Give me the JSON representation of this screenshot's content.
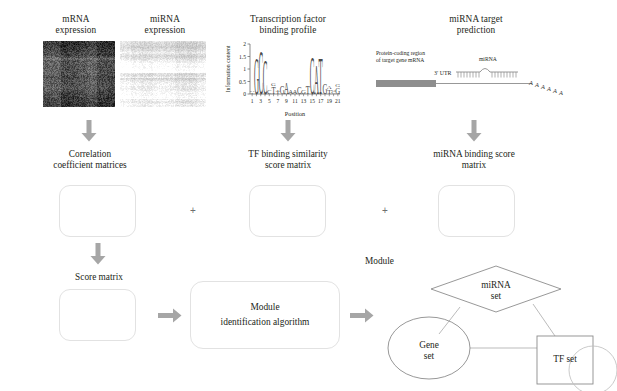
{
  "figure": {
    "panels": {
      "mrna": {
        "title_line1": "mRNA",
        "title_line2": "expression",
        "icon": "heatmap-dark"
      },
      "mirna": {
        "title_line1": "miRNA",
        "title_line2": "expression",
        "icon": "heatmap-light"
      },
      "tf": {
        "title_line1": "Transcription factor",
        "title_line2": "binding profile"
      },
      "target": {
        "title_line1": "miRNA target",
        "title_line2": "prediction"
      }
    },
    "target_schematic": {
      "coding_label_line1": "Protein-coding region",
      "coding_label_line2": "of target gene mRNA",
      "utr_label": "3′ UTR",
      "mirna_label": "miRNA",
      "polya_label": "AAAAAA"
    },
    "row2": {
      "boxes": [
        {
          "label_line1": "Correlation",
          "label_line2": "coefficient matrices"
        },
        {
          "label_line1": "TF binding similarity",
          "label_line2": "score matrix"
        },
        {
          "label_line1": "miRNA binding score",
          "label_line2": "matrix"
        }
      ],
      "operator": "+"
    },
    "row3": {
      "score_matrix_label": "Score matrix",
      "algorithm_line1": "Module",
      "algorithm_line2": "identification algorithm"
    },
    "module": {
      "caption": "Module",
      "mirna_set_line1": "miRNA",
      "mirna_set_line2": "set",
      "gene_set_line1": "Gene",
      "gene_set_line2": "set",
      "tf_set_label": "TF set"
    },
    "colors": {
      "arrow_gray": "#9e9e9e",
      "box_border": "#e2e2e2",
      "shape_stroke": "#8c8c8c",
      "text": "#231f20"
    }
  },
  "chart_data": {
    "type": "bar",
    "title": "Transcription factor binding profile",
    "xlabel": "Position",
    "ylabel": "Information content",
    "ylim": [
      0,
      2
    ],
    "yticks": [
      0,
      0.5,
      1,
      1.5,
      2
    ],
    "ytick_labels": [
      "0",
      "0.5",
      "1",
      "1.5",
      "2"
    ],
    "xticks": [
      1,
      3,
      5,
      7,
      9,
      11,
      13,
      15,
      17,
      19,
      21
    ],
    "xtick_labels": [
      "1",
      "3",
      "5",
      "7",
      "9",
      "11",
      "13",
      "15",
      "17",
      "19",
      "21"
    ],
    "categories": [
      1,
      2,
      3,
      4,
      5,
      6,
      7,
      8,
      9,
      10,
      11,
      12,
      13,
      14,
      15,
      16,
      17,
      18,
      19,
      20,
      21
    ],
    "values": [
      0.12,
      1.62,
      1.95,
      1.55,
      0.18,
      0.42,
      0.22,
      0.4,
      0.5,
      0.22,
      0.16,
      0.3,
      0.22,
      0.36,
      1.7,
      1.3,
      1.62,
      0.42,
      0.3,
      0.18,
      0.4
    ],
    "grid": false,
    "legend": false
  }
}
